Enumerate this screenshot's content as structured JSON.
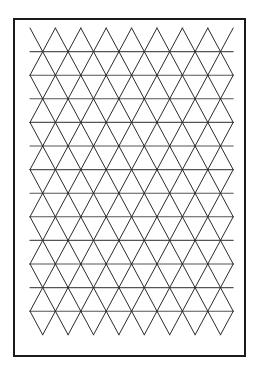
{
  "figure": {
    "background_color": "#ffffff",
    "caption": ""
  },
  "frame": {
    "name": "outer-rectangle-border",
    "x": 14,
    "y": 19,
    "width": 231,
    "height": 337,
    "stroke_color": "#1a1a1a",
    "stroke_width": 2,
    "fill_color": "#ffffff"
  },
  "chart_data": {
    "type": "line",
    "xlabel": "",
    "ylabel": "",
    "grid": true,
    "legend_position": "none",
    "lattice": {
      "origin_x": 30,
      "origin_y": 28,
      "cell_width": 25.4,
      "row_height": 23.6,
      "columns": 8,
      "rows": 13,
      "stroke_color": "#2b2b2b",
      "stroke_width": 1,
      "horizontal_line_color": "#555555",
      "horizontal_line_width": 1.1,
      "description": "Equilateral triangle tiling: horizontal rows of lines with alternating up and down diagonals forming triangles; top row begins with upward apexes, bottom row ends with downward apexes."
    }
  }
}
